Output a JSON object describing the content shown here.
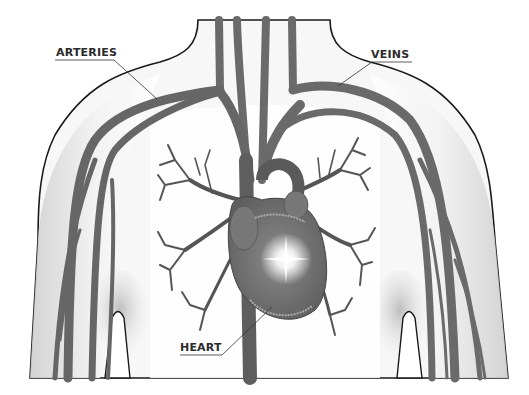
{
  "diagram": {
    "style": "grayscale medical illustration",
    "labels": [
      {
        "id": "arteries",
        "text": "ARTERIES"
      },
      {
        "id": "veins",
        "text": "VEINS"
      },
      {
        "id": "heart",
        "text": "HEART"
      }
    ],
    "colors": {
      "vessel": "#6e6e6e",
      "vessel_dark": "#555555",
      "skin_shade": "#d9d9d9",
      "outline": "#1a1a1a",
      "label_text": "#2b2b2b",
      "heart": "#7a7a7a",
      "glow": "#ffffff"
    }
  }
}
